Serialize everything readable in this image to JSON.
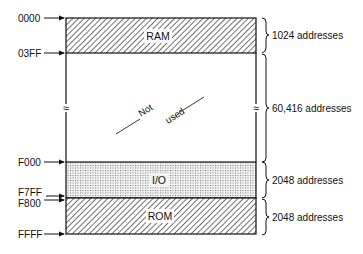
{
  "diagram": {
    "type": "memory-map",
    "colors": {
      "line": "#111111",
      "background": "#ffffff",
      "hatch": "#333333",
      "dots": "#666666"
    },
    "addresses": [
      {
        "id": "a0000",
        "label": "0000"
      },
      {
        "id": "a03ff",
        "label": "03FF"
      },
      {
        "id": "af000",
        "label": "F000"
      },
      {
        "id": "af7ff",
        "label": "F7FF"
      },
      {
        "id": "af800",
        "label": "F800"
      },
      {
        "id": "affff",
        "label": "FFFF"
      }
    ],
    "segments": [
      {
        "id": "ram",
        "label": "RAM",
        "fill": "diagonal-hatch",
        "size_label": "1024 addresses"
      },
      {
        "id": "unused",
        "label_parts": [
          "Not",
          "used"
        ],
        "fill": "none",
        "size_label": "60,416 addresses",
        "break_mark": "≈"
      },
      {
        "id": "io",
        "label": "I/O",
        "fill": "dotted",
        "size_label": "2048 addresses"
      },
      {
        "id": "rom",
        "label": "ROM",
        "fill": "diagonal-hatch",
        "size_label": "2048 addresses"
      }
    ]
  }
}
